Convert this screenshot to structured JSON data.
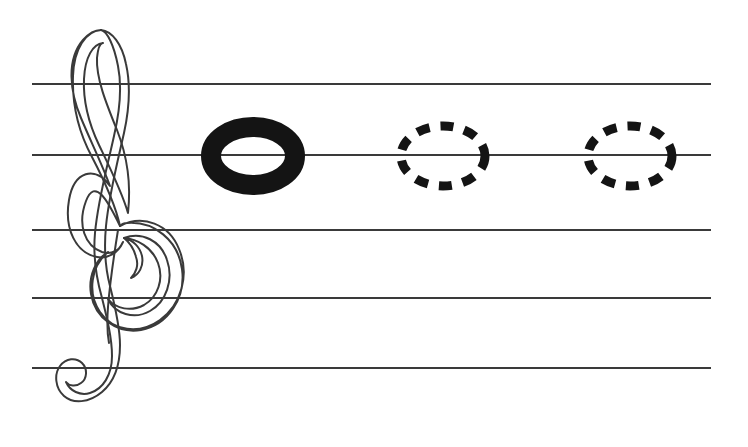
{
  "document": {
    "title": "Music Staff Note Tracing Worksheet",
    "type": "music-notation-exercise",
    "background_color": "#ffffff",
    "width": 748,
    "height": 447
  },
  "staff": {
    "name": "five-line-staff",
    "line_count": 5,
    "line_color": "#3a3a3a",
    "line_thickness": 2,
    "x_start": 32,
    "x_end": 711,
    "line_y": [
      84,
      155,
      230,
      298,
      368
    ],
    "line_labels": [
      "line-1-top",
      "line-2",
      "line-3-middle",
      "line-4",
      "line-5-bottom"
    ]
  },
  "clef": {
    "name": "treble-clef",
    "symbol": "G-clef",
    "style": "outline",
    "stroke_color": "#3a3a3a",
    "fill": "none",
    "stroke_width": 2,
    "bounds": {
      "x": 44,
      "y": 28,
      "width": 130,
      "height": 390
    }
  },
  "notes": [
    {
      "name": "filled-note-head",
      "style": "solid",
      "fill_color": "#141414",
      "stroke_color": "#141414",
      "center_x": 253,
      "center_y": 156,
      "radius_x": 52,
      "radius_y": 38,
      "ring_thickness": 20,
      "staff_position": "line-2",
      "label": "example note"
    },
    {
      "name": "dashed-note-outline-1",
      "style": "dashed",
      "fill_color": "none",
      "stroke_color": "#141414",
      "center_x": 443,
      "center_y": 156,
      "radius_x": 46,
      "radius_y": 34,
      "stroke_width": 9,
      "dash_pattern": "13 11",
      "staff_position": "line-2",
      "label": "trace here"
    },
    {
      "name": "dashed-note-outline-2",
      "style": "dashed",
      "fill_color": "none",
      "stroke_color": "#141414",
      "center_x": 630,
      "center_y": 156,
      "radius_x": 46,
      "radius_y": 34,
      "stroke_width": 9,
      "dash_pattern": "13 11",
      "staff_position": "line-2",
      "label": "trace here"
    }
  ],
  "accessibility": {
    "staff_description": "Five horizontal staff lines",
    "clef_description": "Treble clef outline at the left of the staff",
    "note_description": "One solid note head followed by two dashed note head tracing guides on the second staff line"
  }
}
